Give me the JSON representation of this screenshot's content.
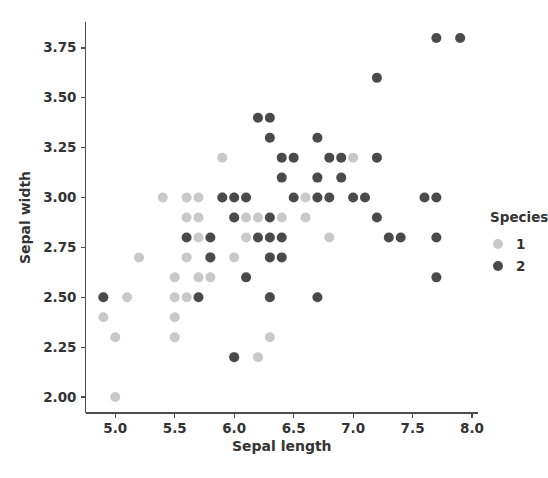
{
  "chart_data": {
    "type": "scatter",
    "title": "",
    "xlabel": "Sepal length",
    "ylabel": "Sepal width",
    "xlim": [
      4.75,
      8.05
    ],
    "ylim": [
      1.92,
      3.88
    ],
    "xticks": [
      "5.0",
      "5.5",
      "6.0",
      "6.5",
      "7.0",
      "7.5",
      "8.0"
    ],
    "xtick_values": [
      5.0,
      5.5,
      6.0,
      6.5,
      7.0,
      7.5,
      8.0
    ],
    "yticks": [
      "2.00",
      "2.25",
      "2.50",
      "2.75",
      "3.00",
      "3.25",
      "3.50",
      "3.75"
    ],
    "ytick_values": [
      2.0,
      2.25,
      2.5,
      2.75,
      3.0,
      3.25,
      3.5,
      3.75
    ],
    "grid": false,
    "legend_position": "right",
    "legend": {
      "title": "Species",
      "entries": [
        {
          "label": "1",
          "color": "#c9c9c9"
        },
        {
          "label": "2",
          "color": "#4a4a4a"
        }
      ]
    },
    "marker_size": 6,
    "series": [
      {
        "name": "1",
        "color": "#c9c9c9",
        "points": [
          [
            4.9,
            2.4
          ],
          [
            4.9,
            2.5
          ],
          [
            5.0,
            2.0
          ],
          [
            5.0,
            2.3
          ],
          [
            5.1,
            2.5
          ],
          [
            5.2,
            2.7
          ],
          [
            5.4,
            3.0
          ],
          [
            5.5,
            2.3
          ],
          [
            5.5,
            2.4
          ],
          [
            5.5,
            2.5
          ],
          [
            5.5,
            2.6
          ],
          [
            5.6,
            2.5
          ],
          [
            5.6,
            2.7
          ],
          [
            5.6,
            2.9
          ],
          [
            5.6,
            3.0
          ],
          [
            5.7,
            2.6
          ],
          [
            5.7,
            2.8
          ],
          [
            5.7,
            2.9
          ],
          [
            5.7,
            3.0
          ],
          [
            5.8,
            2.6
          ],
          [
            5.8,
            2.7
          ],
          [
            5.9,
            3.0
          ],
          [
            5.9,
            3.2
          ],
          [
            6.0,
            2.2
          ],
          [
            6.0,
            2.7
          ],
          [
            6.0,
            2.9
          ],
          [
            6.1,
            2.8
          ],
          [
            6.1,
            2.9
          ],
          [
            6.2,
            2.2
          ],
          [
            6.2,
            2.9
          ],
          [
            6.3,
            2.3
          ],
          [
            6.3,
            2.5
          ],
          [
            6.4,
            2.9
          ],
          [
            6.6,
            2.9
          ],
          [
            6.6,
            3.0
          ],
          [
            6.7,
            3.0
          ],
          [
            6.7,
            3.1
          ],
          [
            6.8,
            2.8
          ],
          [
            7.0,
            3.2
          ]
        ]
      },
      {
        "name": "2",
        "color": "#4a4a4a",
        "points": [
          [
            4.9,
            2.5
          ],
          [
            5.6,
            2.8
          ],
          [
            5.7,
            2.5
          ],
          [
            5.8,
            2.7
          ],
          [
            5.8,
            2.8
          ],
          [
            5.9,
            3.0
          ],
          [
            6.0,
            2.2
          ],
          [
            6.0,
            2.9
          ],
          [
            6.0,
            3.0
          ],
          [
            6.1,
            2.6
          ],
          [
            6.1,
            3.0
          ],
          [
            6.2,
            2.8
          ],
          [
            6.2,
            3.4
          ],
          [
            6.3,
            2.5
          ],
          [
            6.3,
            2.7
          ],
          [
            6.3,
            2.8
          ],
          [
            6.3,
            2.9
          ],
          [
            6.3,
            3.3
          ],
          [
            6.3,
            3.4
          ],
          [
            6.4,
            2.7
          ],
          [
            6.4,
            2.8
          ],
          [
            6.4,
            3.1
          ],
          [
            6.4,
            3.2
          ],
          [
            6.5,
            3.0
          ],
          [
            6.5,
            3.2
          ],
          [
            6.7,
            2.5
          ],
          [
            6.7,
            3.0
          ],
          [
            6.7,
            3.1
          ],
          [
            6.7,
            3.3
          ],
          [
            6.8,
            3.0
          ],
          [
            6.8,
            3.2
          ],
          [
            6.9,
            3.1
          ],
          [
            6.9,
            3.2
          ],
          [
            7.0,
            3.0
          ],
          [
            7.1,
            3.0
          ],
          [
            7.2,
            2.9
          ],
          [
            7.2,
            3.2
          ],
          [
            7.2,
            3.6
          ],
          [
            7.3,
            2.8
          ],
          [
            7.4,
            2.8
          ],
          [
            7.6,
            3.0
          ],
          [
            7.7,
            2.6
          ],
          [
            7.7,
            2.8
          ],
          [
            7.7,
            3.0
          ],
          [
            7.7,
            3.8
          ],
          [
            7.9,
            3.8
          ]
        ]
      }
    ]
  }
}
